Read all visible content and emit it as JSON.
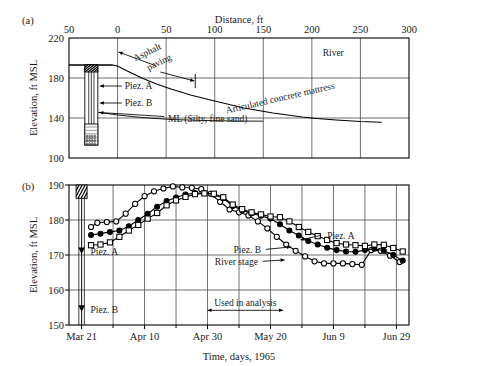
{
  "figure": {
    "panel_a_letter": "(a)",
    "panel_b_letter": "(b)"
  },
  "panel_a": {
    "x_axis_title": "Distance, ft",
    "y_axis_title": "Elevation, ft MSL",
    "x_ticks": [
      "50",
      "0",
      "50",
      "100",
      "150",
      "200",
      "250",
      "300"
    ],
    "x_tick_values": [
      -50,
      0,
      50,
      100,
      150,
      200,
      250,
      300
    ],
    "y_ticks": [
      "220",
      "180",
      "140",
      "100"
    ],
    "y_tick_values": [
      220,
      180,
      140,
      100
    ],
    "xlim": [
      -50,
      300
    ],
    "ylim": [
      100,
      220
    ],
    "labels": {
      "asphalt": "Asphalt",
      "paving": "paving",
      "mattress": "Articulated concrete mattress",
      "river": "River",
      "soil": "ML (Silty, fine sand)",
      "piez_a": "Piez. A",
      "piez_b": "Piez. B"
    },
    "ground_profile": [
      [
        -50,
        193
      ],
      [
        -22,
        193
      ],
      [
        -5,
        193
      ],
      [
        0,
        192
      ],
      [
        10,
        187
      ],
      [
        25,
        180
      ],
      [
        40,
        174
      ],
      [
        55,
        169
      ],
      [
        75,
        163
      ],
      [
        100,
        157
      ],
      [
        130,
        150
      ],
      [
        160,
        145
      ],
      [
        190,
        141
      ],
      [
        205,
        139.5
      ],
      [
        225,
        138
      ],
      [
        250,
        136.5
      ],
      [
        272,
        135.8
      ]
    ],
    "soil_boundary": [
      [
        -22,
        146
      ],
      [
        0,
        143
      ],
      [
        25,
        140.5
      ],
      [
        55,
        138.5
      ],
      [
        90,
        137.5
      ],
      [
        120,
        137
      ],
      [
        150,
        136.8
      ]
    ],
    "bench_top": [
      [
        -50,
        193
      ],
      [
        -5,
        193
      ]
    ],
    "borehole": {
      "x_center": -27,
      "top_elev": 193,
      "bottom_elev": 113,
      "hatch_top_elev": 193,
      "hatch_bottom_elev": 186,
      "pack_top_elev": 134,
      "screen_a_elev": 172,
      "screen_b_elev": 155,
      "screen_c_elev": 143
    },
    "extent_arrow": {
      "left_x": 0,
      "left_elev": 206,
      "right_x": 80,
      "right_elev": 177
    },
    "vertical_tick": {
      "x": 80,
      "elev_top": 184,
      "elev_bottom": 170
    }
  },
  "panel_b": {
    "x_axis_title": "Time, days, 1965",
    "y_axis_title": "Elevation, ft MSL",
    "x_ticks": [
      "Mar 21",
      "Apr 10",
      "Apr 30",
      "May 20",
      "Jun 9",
      "Jun 29"
    ],
    "x_tick_values": [
      0,
      20,
      40,
      60,
      80,
      100
    ],
    "x_minor_values": [
      10,
      30,
      50,
      70,
      90
    ],
    "y_ticks": [
      "190",
      "180",
      "170",
      "160",
      "150"
    ],
    "y_tick_values": [
      190,
      180,
      170,
      160,
      150
    ],
    "xlim": [
      -4,
      104
    ],
    "ylim": [
      150,
      190
    ],
    "labels": {
      "piez_a": "Piez. A",
      "piez_b": "Piez. B",
      "river_stage": "River stage",
      "used_in_analysis": "Used in analysis",
      "screen_piez_a": "Piez. A",
      "screen_piez_b": "Piez. B"
    },
    "screen_markers": [
      {
        "name": "Piez. A",
        "elev": 171.0
      },
      {
        "name": "Piez. B",
        "elev": 154.5
      }
    ],
    "used_in_analysis": {
      "start": 40,
      "end": 64,
      "elev": 154.2
    },
    "borehole": {
      "x_center": 0,
      "top_elev": 190,
      "bottom_elev": 150,
      "hatch_top_elev": 190,
      "hatch_bottom_elev": 186.2
    }
  },
  "chart_data": [
    {
      "type": "line",
      "title": "(a) Cross section: bank profile and piezometer installation",
      "xlabel": "Distance, ft",
      "ylabel": "Elevation, ft MSL",
      "xlim": [
        -50,
        300
      ],
      "ylim": [
        100,
        220
      ],
      "grid": true,
      "legend": "none",
      "annotations": [
        "Asphalt paving",
        "Articulated concrete mattress",
        "River",
        "ML (Silty, fine sand)",
        "Piez. A",
        "Piez. B"
      ],
      "series": [
        {
          "name": "Ground / revetment surface",
          "x": [
            -50,
            -22,
            -5,
            0,
            10,
            25,
            40,
            55,
            75,
            100,
            130,
            160,
            190,
            205,
            225,
            250,
            272
          ],
          "values": [
            193,
            193,
            193,
            192,
            187,
            180,
            174,
            169,
            163,
            157,
            150,
            145,
            141,
            139.5,
            138,
            136.5,
            135.8
          ]
        },
        {
          "name": "ML (Silty, fine sand) boundary",
          "x": [
            -22,
            0,
            25,
            55,
            90,
            120,
            150
          ],
          "values": [
            146,
            143,
            140.5,
            138.5,
            137.5,
            137,
            136.8
          ]
        }
      ]
    },
    {
      "type": "line",
      "title": "(b) River stage and piezometric elevations vs. time, 1965",
      "xlabel": "Time, days, 1965",
      "ylabel": "Elevation, ft MSL",
      "xlim": [
        -4,
        104
      ],
      "ylim": [
        150,
        190
      ],
      "grid": true,
      "legend": "inline-labels",
      "x_tick_labels": [
        "Mar 21",
        "Apr 10",
        "Apr 30",
        "May 20",
        "Jun 9",
        "Jun 29"
      ],
      "x_tick_positions": [
        0,
        20,
        40,
        60,
        80,
        100
      ],
      "annotations": [
        "Piez. A",
        "Piez. B",
        "River stage",
        "Used in analysis"
      ],
      "series": [
        {
          "name": "River stage",
          "marker": "open-circle",
          "x": [
            3,
            5,
            8,
            11,
            14,
            17,
            20,
            23,
            26,
            29,
            32,
            35,
            38,
            41,
            44,
            47,
            50,
            53,
            56,
            59,
            62,
            65,
            68,
            71,
            74,
            77,
            80,
            83,
            86,
            89,
            92,
            95,
            98,
            101
          ],
          "values": [
            178.0,
            179.2,
            179.4,
            179.6,
            181.8,
            184.6,
            186.8,
            188.2,
            189.0,
            189.6,
            189.3,
            189.2,
            188.8,
            187.5,
            185.2,
            183.0,
            182.2,
            181.3,
            179.6,
            177.6,
            175.2,
            173.0,
            171.2,
            169.6,
            168.2,
            167.6,
            167.6,
            167.6,
            167.4,
            167.2,
            171.4,
            171.2,
            169.8,
            168.0
          ]
        },
        {
          "name": "Piez. B",
          "marker": "filled-circle",
          "x": [
            3,
            6,
            9,
            12,
            15,
            18,
            21,
            24,
            27,
            30,
            33,
            36,
            39,
            42,
            45,
            48,
            51,
            54,
            57,
            60,
            63,
            66,
            69,
            72,
            75,
            78,
            81,
            84,
            87,
            90,
            93,
            96,
            99,
            102
          ],
          "values": [
            175.7,
            176.1,
            176.6,
            177.0,
            178.2,
            180.0,
            181.8,
            183.8,
            185.4,
            186.4,
            187.3,
            187.7,
            187.7,
            187.3,
            186.2,
            184.0,
            182.8,
            181.9,
            181.2,
            180.4,
            178.8,
            177.0,
            175.6,
            174.0,
            173.0,
            172.1,
            171.4,
            171.0,
            170.9,
            171.4,
            171.8,
            171.2,
            170.0,
            168.4
          ]
        },
        {
          "name": "Piez. A",
          "marker": "open-square",
          "x": [
            3,
            6,
            9,
            12,
            15,
            18,
            21,
            24,
            27,
            30,
            33,
            36,
            39,
            42,
            45,
            48,
            51,
            54,
            57,
            60,
            63,
            66,
            69,
            72,
            75,
            78,
            81,
            84,
            87,
            90,
            93,
            96,
            99,
            102
          ],
          "values": [
            172.8,
            173.0,
            173.6,
            175.2,
            177.0,
            178.6,
            180.4,
            182.0,
            184.2,
            185.6,
            186.6,
            187.4,
            187.6,
            187.5,
            186.5,
            184.4,
            183.1,
            182.2,
            181.6,
            181.0,
            180.8,
            179.6,
            178.0,
            176.6,
            175.4,
            174.3,
            173.4,
            173.0,
            172.8,
            172.6,
            173.0,
            172.9,
            172.0,
            171.0
          ]
        }
      ]
    }
  ]
}
